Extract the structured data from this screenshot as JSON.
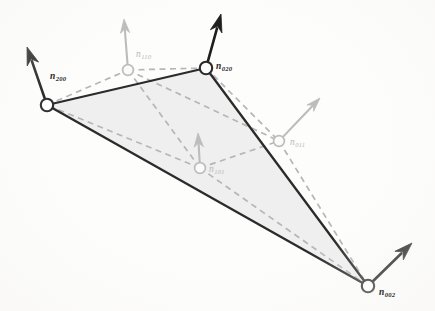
{
  "figure": {
    "background_color": "#fdfdfc",
    "triangle_fill_color": "#ececec",
    "solid_edge_color": "#2b2b2b",
    "dashed_net_color": "#b6b6b6",
    "corner_node_stroke": "#2b2b2b",
    "corner_node_fill": "#ffffff",
    "mid_node_stroke": "#bdbdbd",
    "mid_node_fill": "#fbfbfb",
    "corner_arrow_color": "#1f1f1f",
    "mid_arrow_color": "#bcbcbc"
  },
  "nodes": [
    {
      "id": "n200",
      "label": "n",
      "subscript": "200",
      "kind": "corner",
      "x": 47,
      "y": 105,
      "radius": 6.2,
      "label_x": 50,
      "label_y": 72,
      "arrow": {
        "tip_x": 27,
        "tip_y": 47,
        "color": "#1f1f1f",
        "width": 2.6
      }
    },
    {
      "id": "n110",
      "label": "n",
      "subscript": "110",
      "kind": "mid",
      "x": 128,
      "y": 70,
      "radius": 5.4,
      "label_x": 136,
      "label_y": 50,
      "arrow": {
        "tip_x": 124,
        "tip_y": 19,
        "color": "#bcbcbc",
        "width": 2.1
      }
    },
    {
      "id": "n020",
      "label": "n",
      "subscript": "020",
      "kind": "corner",
      "x": 206,
      "y": 68,
      "radius": 6.2,
      "label_x": 216,
      "label_y": 62,
      "arrow": {
        "tip_x": 221,
        "tip_y": 14,
        "color": "#1f1f1f",
        "width": 2.6
      }
    },
    {
      "id": "n101",
      "label": "n",
      "subscript": "101",
      "kind": "mid",
      "x": 200,
      "y": 168,
      "radius": 5.4,
      "label_x": 209,
      "label_y": 165,
      "arrow": {
        "tip_x": 198,
        "tip_y": 133,
        "color": "#bcbcbc",
        "width": 2.1
      }
    },
    {
      "id": "n011",
      "label": "n",
      "subscript": "011",
      "kind": "mid",
      "x": 279,
      "y": 141,
      "label_x": 290,
      "label_y": 138,
      "radius": 5.4,
      "arrow": {
        "tip_x": 320,
        "tip_y": 98,
        "color": "#bcbcbc",
        "width": 2.1
      }
    },
    {
      "id": "n002",
      "label": "n",
      "subscript": "002",
      "kind": "corner",
      "x": 368,
      "y": 286,
      "radius": 6.2,
      "label_x": 379,
      "label_y": 288,
      "arrow": {
        "tip_x": 412,
        "tip_y": 243,
        "color": "#1f1f1f",
        "width": 2.6
      }
    }
  ],
  "solid_edges": [
    {
      "from": "n200",
      "to": "n020"
    },
    {
      "from": "n020",
      "to": "n002"
    },
    {
      "from": "n002",
      "to": "n200"
    }
  ],
  "dashed_edges": [
    {
      "from": "n200",
      "to": "n110"
    },
    {
      "from": "n110",
      "to": "n020"
    },
    {
      "from": "n020",
      "to": "n011"
    },
    {
      "from": "n011",
      "to": "n002"
    },
    {
      "from": "n002",
      "to": "n101"
    },
    {
      "from": "n101",
      "to": "n200"
    },
    {
      "from": "n110",
      "to": "n101"
    },
    {
      "from": "n110",
      "to": "n011"
    },
    {
      "from": "n101",
      "to": "n011"
    }
  ]
}
